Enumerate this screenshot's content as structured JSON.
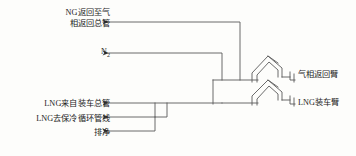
{
  "diagram": {
    "background_color": "#fdfdfb",
    "line_color": "#5a5a5a",
    "text_color": "#1c1c1c",
    "left_labels": [
      {
        "id": "ng-return",
        "line1": "NG返回至气",
        "line2": "相返回总管"
      },
      {
        "id": "nitrogen",
        "text": "N",
        "subscript": "2"
      },
      {
        "id": "lng-from-loading-main",
        "text": "LNG来自装车总管"
      },
      {
        "id": "lng-to-cooling-line",
        "text": "LNG去保冷循环管线"
      },
      {
        "id": "drain",
        "text": "排净"
      }
    ],
    "right_labels": [
      {
        "id": "gas-return-arm",
        "text": "气相返回臂"
      },
      {
        "id": "lng-loading-arm",
        "text": "LNG装车臂"
      }
    ]
  }
}
